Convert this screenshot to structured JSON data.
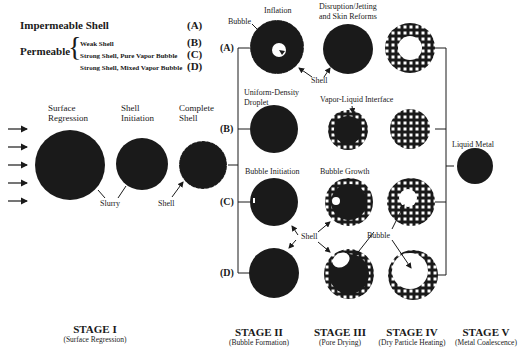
{
  "legend": {
    "impermeable": {
      "label": "Impermeable Shell",
      "code": "(A)"
    },
    "permeable": {
      "label": "Permeable",
      "items": [
        {
          "label": "Weak Shell",
          "code": "(B)"
        },
        {
          "label": "Strong Shell, Pure Vapor Bubble",
          "code": "(C)"
        },
        {
          "label": "Strong Shell, Mixed Vapor Bubble",
          "code": "(D)"
        }
      ]
    }
  },
  "stage1": {
    "labels": {
      "surface_regression": [
        "Surface",
        "Regression"
      ],
      "shell_initiation": [
        "Shell",
        "Initiation"
      ],
      "complete_shell": [
        "Complete",
        "Shell"
      ]
    },
    "annotations": {
      "slurry": "Slurry",
      "shell": "Shell"
    }
  },
  "paths": {
    "A": {
      "code": "(A)",
      "labels": {
        "bubble": "Bubble",
        "inflation": "Inflation",
        "disruption": [
          "Disruption/Jetting",
          "and Skin Reforms"
        ],
        "shell": "Shell"
      }
    },
    "B": {
      "code": "(B)",
      "labels": {
        "droplet": [
          "Uniform-Density",
          "Droplet"
        ],
        "interface": "Vapor-Liquid Interface"
      }
    },
    "C": {
      "code": "(C)",
      "labels": {
        "initiation": "Bubble Initiation",
        "growth": "Bubble Growth"
      }
    },
    "D": {
      "code": "(D)",
      "labels": {
        "shell": "Shell",
        "bubble": "Bubble"
      }
    }
  },
  "final": {
    "label": "Liquid Metal"
  },
  "stages": [
    {
      "title": "STAGE I",
      "subtitle": "(Surface Regression)"
    },
    {
      "title": "STAGE II",
      "subtitle": "(Bubble Formation)"
    },
    {
      "title": "STAGE III",
      "subtitle": "(Pore Drying)"
    },
    {
      "title": "STAGE IV",
      "subtitle": "(Dry Particle Heating)"
    },
    {
      "title": "STAGE V",
      "subtitle": "(Metal Coalescence)"
    }
  ],
  "colors": {
    "ink": "#1a1a1a",
    "paper": "#ffffff"
  }
}
